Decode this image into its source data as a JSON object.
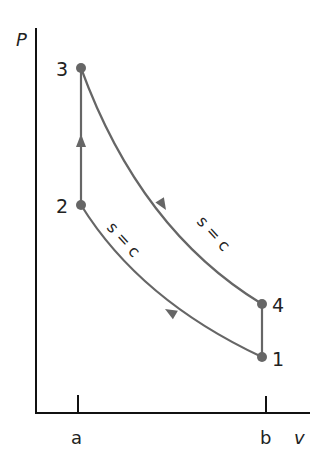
{
  "diagram": {
    "type": "P-v diagram (Otto cycle)",
    "axes": {
      "y_label": "P",
      "x_label": "v",
      "x_ticks": [
        "a",
        "b"
      ]
    },
    "points": [
      {
        "id": "1",
        "label": "1",
        "v": "b",
        "P_rel": 0.14
      },
      {
        "id": "2",
        "label": "2",
        "v": "a",
        "P_rel": 0.55
      },
      {
        "id": "3",
        "label": "3",
        "v": "a",
        "P_rel": 0.9
      },
      {
        "id": "4",
        "label": "4",
        "v": "b",
        "P_rel": 0.28
      }
    ],
    "processes": [
      {
        "from": "1",
        "to": "2",
        "label": "s = c",
        "kind": "isentropic compression"
      },
      {
        "from": "2",
        "to": "3",
        "label": "",
        "kind": "constant volume heat addition"
      },
      {
        "from": "3",
        "to": "4",
        "label": "s = c",
        "kind": "isentropic expansion"
      },
      {
        "from": "4",
        "to": "1",
        "label": "",
        "kind": "constant volume heat rejection"
      }
    ],
    "colors": {
      "curve": "#666666",
      "axis": "#111111"
    }
  }
}
